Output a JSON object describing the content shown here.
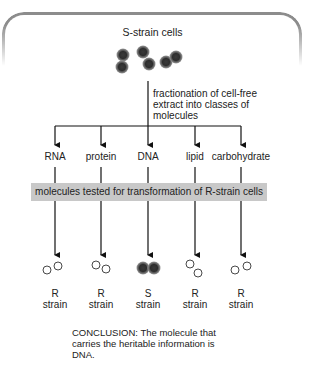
{
  "diagram": {
    "title": "S-strain cells",
    "fractionation_label": "fractionation of cell-free extract into classes of molecules",
    "test_banner": "molecules tested for transformation of R-strain cells",
    "columns": [
      {
        "molecule": "RNA",
        "result_letter": "R",
        "result_word": "strain",
        "cell_type": "R"
      },
      {
        "molecule": "protein",
        "result_letter": "R",
        "result_word": "strain",
        "cell_type": "R"
      },
      {
        "molecule": "DNA",
        "result_letter": "S",
        "result_word": "strain",
        "cell_type": "S"
      },
      {
        "molecule": "lipid",
        "result_letter": "R",
        "result_word": "strain",
        "cell_type": "R"
      },
      {
        "molecule": "carbohydrate",
        "result_letter": "R",
        "result_word": "strain",
        "cell_type": "R"
      }
    ],
    "conclusion": "CONCLUSION: The molecule that carries the heritable information is DNA.",
    "colors": {
      "frame": "#8c8c8c",
      "banner": "#c8c8c8",
      "s_cell_outer": "#6e6e6e",
      "s_cell_inner": "#3a3a3a",
      "lines": "#111111"
    }
  }
}
